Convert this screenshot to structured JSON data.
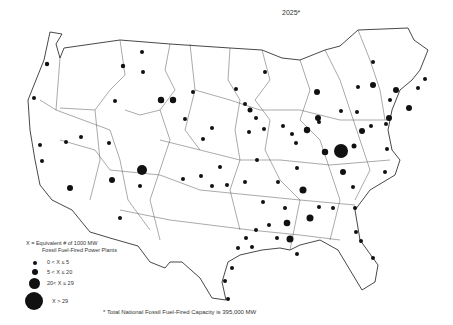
{
  "map": {
    "title": "2025",
    "title_marker": "*",
    "legend": {
      "heading_line1": "X = Equivalent # of 1000 MW",
      "heading_line2": "Fossil Fuel-Fired Power Plants",
      "items": [
        {
          "label": "0 < X ≤ 5",
          "size": "small"
        },
        {
          "label": "5 < X ≤ 20",
          "size": "medium"
        },
        {
          "label": "20< X ≤ 29",
          "size": "large"
        },
        {
          "label": "X > 29",
          "size": "xlarge"
        }
      ]
    },
    "footnote": "*  Total National Fossil Fuel-Fired Capacity is 395,000 MW",
    "colors": {
      "ink": "#111111",
      "border": "#333333",
      "background": "#ffffff"
    }
  }
}
